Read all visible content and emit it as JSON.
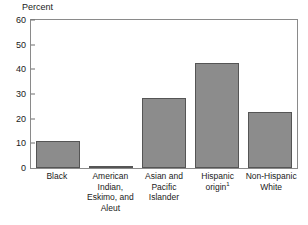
{
  "chart_data": {
    "type": "bar",
    "title": "",
    "subtitle": "",
    "xlabel": "",
    "ylabel": "Percent",
    "ylim": [
      0,
      60
    ],
    "yticks": [
      0,
      10,
      20,
      30,
      40,
      50,
      60
    ],
    "ytick_labels": [
      "0",
      "10",
      "20",
      "30",
      "40",
      "50",
      "60"
    ],
    "grid": false,
    "legend": null,
    "categories": [
      "Black",
      "American Indian, Eskimo, and Aleut",
      "Asian and Pacific Islander",
      "Hispanic origin",
      "Non-Hispanic White"
    ],
    "values": [
      10.8,
      0.4,
      28.5,
      42.5,
      22.6
    ],
    "bar_color": "#8c8c8c",
    "bar_edge_color": "#555555",
    "annotations": [
      "1"
    ]
  },
  "axes": {
    "y_title": "Percent",
    "y_ticks": [
      {
        "label": "60",
        "value": 60
      },
      {
        "label": "50",
        "value": 50
      },
      {
        "label": "40",
        "value": 40
      },
      {
        "label": "30",
        "value": 30
      },
      {
        "label": "20",
        "value": 20
      },
      {
        "label": "10",
        "value": 10
      },
      {
        "label": "0",
        "value": 0
      }
    ]
  },
  "x_categories": [
    {
      "line1": "Black",
      "line2": "",
      "line3": "",
      "line4": "",
      "footnote": ""
    },
    {
      "line1": "American",
      "line2": "Indian,",
      "line3": "Eskimo, and",
      "line4": "Aleut",
      "footnote": ""
    },
    {
      "line1": "Asian and",
      "line2": "Pacific",
      "line3": "Islander",
      "line4": "",
      "footnote": ""
    },
    {
      "line1": "Hispanic",
      "line2": "origin",
      "line3": "",
      "line4": "",
      "footnote": "1"
    },
    {
      "line1": "Non-Hispanic",
      "line2": "White",
      "line3": "",
      "line4": "",
      "footnote": ""
    }
  ]
}
